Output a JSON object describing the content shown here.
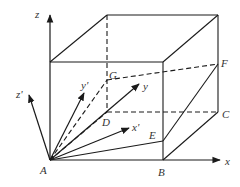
{
  "diagram": {
    "type": "3D coordinate frame with cube",
    "stroke_color": "#1a1a1a",
    "label_color": "#333333",
    "axes": {
      "x": "x",
      "z": "z",
      "x_prime": "x'",
      "y": "y",
      "y_prime": "y'",
      "z_prime": "z'"
    },
    "points": {
      "A": "A",
      "B": "B",
      "C": "C",
      "D": "D",
      "E": "E",
      "F": "F",
      "G": "G"
    }
  }
}
